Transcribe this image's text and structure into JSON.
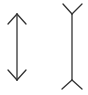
{
  "diagram": {
    "kind": "muller-lyer-illusion",
    "background": "#ffffff",
    "stroke_color": "#333333",
    "stroke_width": 1.3,
    "figures": [
      {
        "id": "inward-arrows",
        "shaft": {
          "x1": 17,
          "y1": 14,
          "x2": 17,
          "y2": 80
        },
        "fins": [
          {
            "x1": 17,
            "y1": 14,
            "x2": 8,
            "y2": 24
          },
          {
            "x1": 17,
            "y1": 14,
            "x2": 26,
            "y2": 24
          },
          {
            "x1": 17,
            "y1": 80,
            "x2": 8,
            "y2": 70
          },
          {
            "x1": 17,
            "y1": 80,
            "x2": 26,
            "y2": 70
          }
        ]
      },
      {
        "id": "outward-fins",
        "shaft": {
          "x1": 72,
          "y1": 14,
          "x2": 72,
          "y2": 80
        },
        "fins": [
          {
            "x1": 72,
            "y1": 14,
            "x2": 63,
            "y2": 4
          },
          {
            "x1": 72,
            "y1": 14,
            "x2": 82,
            "y2": 4
          },
          {
            "x1": 72,
            "y1": 80,
            "x2": 62,
            "y2": 89
          },
          {
            "x1": 72,
            "y1": 80,
            "x2": 82,
            "y2": 89
          }
        ]
      }
    ]
  }
}
